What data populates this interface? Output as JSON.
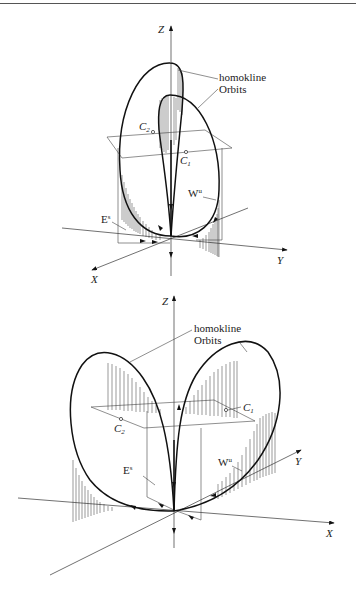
{
  "figure": {
    "panels": [
      {
        "id": "top",
        "axes": {
          "z": "Z",
          "x": "X",
          "y": "Y"
        },
        "labels": {
          "orbits_line1": "homokline",
          "orbits_line2": "Orbits",
          "c1": "C",
          "c1_sub": "1",
          "c2": "C",
          "c2_sub": "2",
          "wu": "W",
          "wu_sup": "u",
          "es": "E",
          "es_sup": "s"
        }
      },
      {
        "id": "bottom",
        "axes": {
          "z": "Z",
          "x": "X",
          "y": "Y"
        },
        "labels": {
          "orbits_line1": "homokline",
          "orbits_line2": "Orbits",
          "c1": "C",
          "c1_sub": "1",
          "c2": "C",
          "c2_sub": "2",
          "wu": "W",
          "wu_sup": "u",
          "es": "E",
          "es_sup": "s"
        }
      }
    ]
  }
}
